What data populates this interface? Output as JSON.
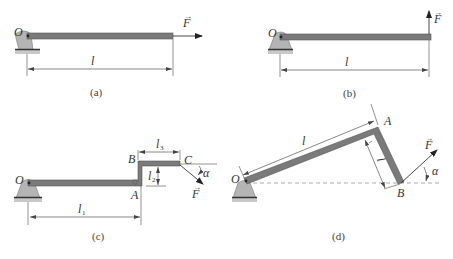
{
  "figures": [
    {
      "id": "a",
      "caption": "(a)",
      "labels": {
        "pivot": "O",
        "length": "l",
        "force": "F"
      },
      "description": "Horizontal bar pivoted at O, force F applied along bar axis at free end"
    },
    {
      "id": "b",
      "caption": "(b)",
      "labels": {
        "pivot": "O",
        "length": "l",
        "force": "F"
      },
      "description": "Horizontal bar pivoted at O, force F applied vertically upward at free end"
    },
    {
      "id": "c",
      "caption": "(c)",
      "labels": {
        "pivot": "O",
        "pointA": "A",
        "pointB": "B",
        "pointC": "C",
        "l1": "l",
        "l1_sub": "1",
        "l2": "l",
        "l2_sub": "2",
        "l3": "l",
        "l3_sub": "3",
        "force": "F",
        "angle": "α"
      },
      "description": "Stepped bar O-A-B-C, force F at C inclined downward at angle α"
    },
    {
      "id": "d",
      "caption": "(d)",
      "labels": {
        "pivot": "O",
        "pointA": "A",
        "pointB": "B",
        "l": "l",
        "l2": "l",
        "l2_sub": "2",
        "force": "F",
        "angle": "α"
      },
      "description": "Inclined bar O-A with perpendicular segment A-B, force F at B inclined upward at angle α"
    }
  ],
  "arrow_glyph": "→"
}
